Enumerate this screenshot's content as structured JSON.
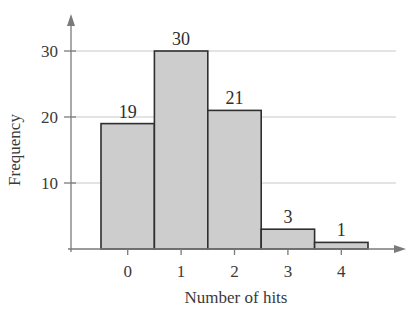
{
  "chart_data": {
    "type": "bar",
    "subtype": "histogram",
    "title": "",
    "xlabel": "Number of hits",
    "ylabel": "Frequency",
    "categories": [
      "0",
      "1",
      "2",
      "3",
      "4"
    ],
    "values": [
      19,
      30,
      21,
      3,
      1
    ],
    "data_labels": [
      "19",
      "30",
      "21",
      "3",
      "1"
    ],
    "yticks": [
      10,
      20,
      30
    ],
    "ylim": [
      0,
      36
    ],
    "grid": {
      "horizontal": true,
      "vertical": false
    },
    "legend": null
  },
  "colors": {
    "bar_fill": "#cdcdcd",
    "bar_stroke": "#2f2f2f",
    "axis": "#7a7a7a",
    "grid": "#c8c8c8",
    "text": "#3a3a3a"
  }
}
